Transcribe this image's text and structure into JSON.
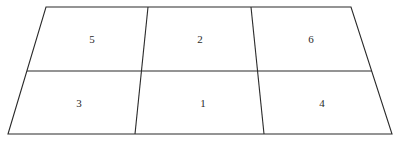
{
  "diagram": {
    "type": "grid-in-perspective",
    "rows": 2,
    "columns": 3,
    "line_color": "#2a2a2a",
    "background_color": "#ffffff",
    "cells": [
      {
        "row": 0,
        "col": 0,
        "label": "5"
      },
      {
        "row": 0,
        "col": 1,
        "label": "2"
      },
      {
        "row": 0,
        "col": 2,
        "label": "6"
      },
      {
        "row": 1,
        "col": 0,
        "label": "3"
      },
      {
        "row": 1,
        "col": 1,
        "label": "1"
      },
      {
        "row": 1,
        "col": 2,
        "label": "4"
      }
    ]
  }
}
